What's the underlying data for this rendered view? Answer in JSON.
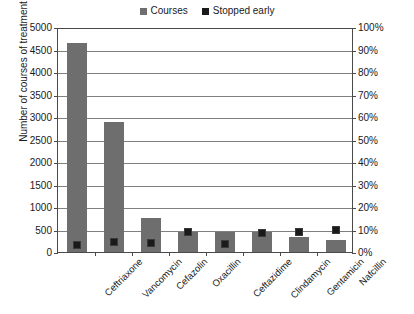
{
  "chart_data": {
    "type": "bar",
    "title": "",
    "subtitle": "",
    "categories": [
      "Ceftriaxone",
      "Vancomycin",
      "Cefazolin",
      "Oxacillin",
      "Ceftazidime",
      "Clindamycin",
      "Gentamicin",
      "Nafcillin"
    ],
    "series": [
      {
        "name": "Courses",
        "type": "bar",
        "axis": "left",
        "color": "#6e6e6e",
        "values": [
          4650,
          2890,
          760,
          450,
          445,
          450,
          330,
          265
        ]
      },
      {
        "name": "Stopped early",
        "type": "scatter",
        "axis": "right",
        "color": "#1a1a1a",
        "unit": "%",
        "values": [
          3,
          4.5,
          4,
          9,
          3.5,
          8.5,
          9,
          10
        ]
      }
    ],
    "xlabel": "",
    "ylabel": "Number of courses of treatment",
    "ylabel_right": "% courses stopped early because of adverse events",
    "ylim": [
      0,
      5000
    ],
    "ylim_right": [
      0,
      100
    ],
    "yticks": [
      "5000",
      "4500",
      "4000",
      "3500",
      "3000",
      "2500",
      "2000",
      "1500",
      "1000",
      "500",
      "0"
    ],
    "yticks_right": [
      "100%",
      "90%",
      "80%",
      "70%",
      "60%",
      "50%",
      "40%",
      "30%",
      "20%",
      "10%",
      "0%"
    ],
    "grid": true,
    "legend_position": "top-center"
  },
  "legend": {
    "entries": [
      {
        "label": "Courses",
        "color": "#6e6e6e"
      },
      {
        "label": "Stopped early",
        "color": "#1a1a1a"
      }
    ]
  }
}
